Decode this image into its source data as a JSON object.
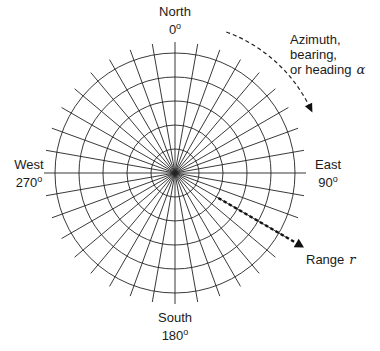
{
  "diagram": {
    "center": {
      "x": 175,
      "y": 173
    },
    "rings": {
      "count": 5,
      "spacing_px": 24
    },
    "spokes": {
      "count": 36,
      "interval_deg": 10,
      "length_px": 131
    },
    "line_color": "#222222",
    "directions": {
      "north": {
        "name": "North",
        "degrees": "0",
        "degree_symbol": "o"
      },
      "east": {
        "name": "East",
        "degrees": "90",
        "degree_symbol": "o"
      },
      "south": {
        "name": "South",
        "degrees": "180",
        "degree_symbol": "o"
      },
      "west": {
        "name": "West",
        "degrees": "270",
        "degree_symbol": "o"
      }
    },
    "azimuth_annotation": {
      "line1": "Azimuth,",
      "line2": "bearing,",
      "line3": "or heading",
      "symbol": "α",
      "arc_style": "dashed",
      "arc_from_deg": 20,
      "arc_to_deg": 64,
      "arc_radius_px": 150
    },
    "range_annotation": {
      "label": "Range",
      "symbol": "r",
      "arrow_style": "dashed-bold",
      "bearing_deg": 120
    }
  }
}
